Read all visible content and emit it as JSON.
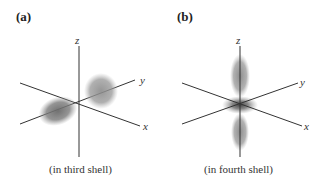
{
  "figure": {
    "panels": [
      {
        "label": "(a)",
        "caption": "(in third shell)",
        "axes": {
          "z": "z",
          "y": "y",
          "x": "x"
        },
        "orbital_shape": "two-lobe (p-type)"
      },
      {
        "label": "(b)",
        "caption": "(in fourth shell)",
        "axes": {
          "z": "z",
          "y": "y",
          "x": "x"
        },
        "orbital_shape": "dz2-type with ring"
      }
    ]
  }
}
